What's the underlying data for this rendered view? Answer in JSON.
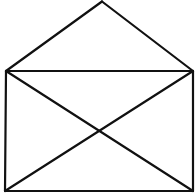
{
  "diagram": {
    "stroke_color": "#111111",
    "background_color": "#ffffff",
    "stroke_width": 2.2,
    "points": {
      "apex": [
        102,
        1.5
      ],
      "top_left": [
        6,
        71
      ],
      "top_right": [
        193,
        71
      ],
      "bottom_left": [
        5,
        191
      ],
      "bottom_right": [
        193,
        191
      ]
    },
    "segments": [
      {
        "name": "roof-left",
        "from": "top_left",
        "to": "apex"
      },
      {
        "name": "roof-right",
        "from": "apex",
        "to": "top_right"
      },
      {
        "name": "rect-top",
        "from": "top_left",
        "to": "top_right"
      },
      {
        "name": "rect-left",
        "from": "top_left",
        "to": "bottom_left"
      },
      {
        "name": "rect-right",
        "from": "top_right",
        "to": "bottom_right"
      },
      {
        "name": "rect-bottom",
        "from": "bottom_left",
        "to": "bottom_right"
      },
      {
        "name": "diagonal-tl-br",
        "from": "top_left",
        "to": "bottom_right"
      },
      {
        "name": "diagonal-tr-bl",
        "from": "top_right",
        "to": "bottom_left"
      }
    ]
  }
}
